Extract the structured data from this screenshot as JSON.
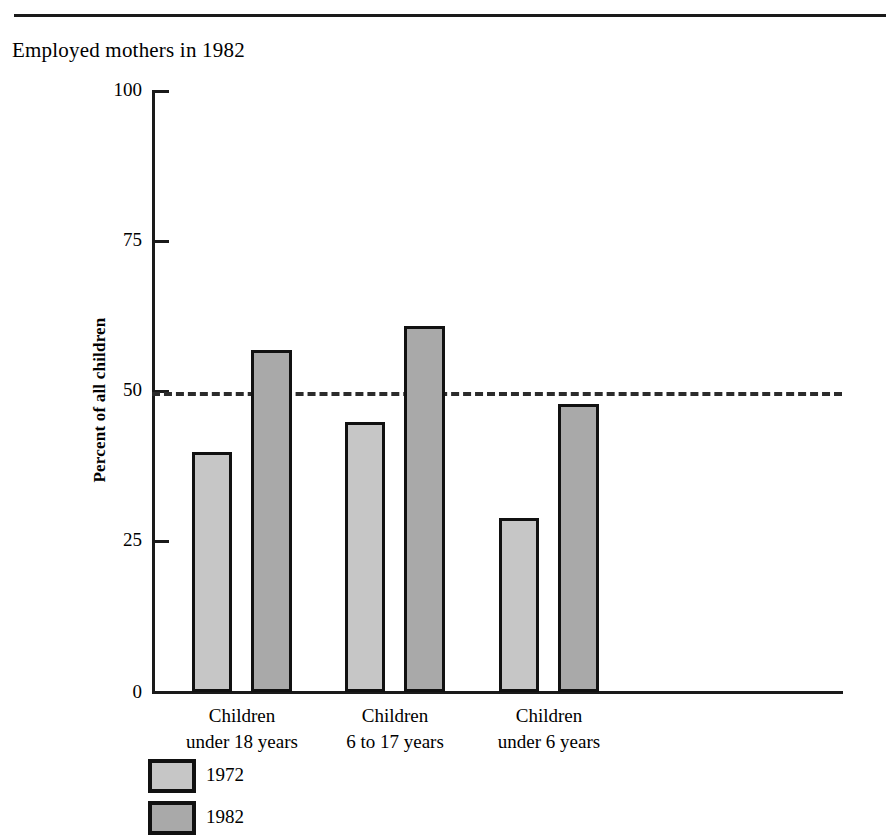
{
  "title": "Employed mothers in 1982",
  "chart_data": {
    "type": "bar",
    "title": "Employed mothers in 1982",
    "xlabel": "",
    "ylabel": "Percent of all children",
    "ylim": [
      0,
      100
    ],
    "yticks": [
      "0",
      "25",
      "50",
      "75",
      "100"
    ],
    "grid": false,
    "legend_position": "bottom-left",
    "reference_line": 50,
    "categories": [
      {
        "line1": "Children",
        "line2": "under 18 years"
      },
      {
        "line1": "Children",
        "line2": "6 to 17 years"
      },
      {
        "line1": "Children",
        "line2": "under 6 years"
      }
    ],
    "category_labels": [
      "Children under 18 years",
      "Children 6 to 17 years",
      "Children under 6 years"
    ],
    "series": [
      {
        "name": "1972",
        "color": "#c6c6c6",
        "values": [
          40,
          45,
          29
        ]
      },
      {
        "name": "1982",
        "color": "#a9a9a9",
        "values": [
          57,
          61,
          48
        ]
      }
    ]
  },
  "axis": {
    "tick_100": "100",
    "tick_75": "75",
    "tick_50": "50",
    "tick_25": "25",
    "tick_0": "0",
    "y_title": "Percent of all children"
  },
  "categories": {
    "c0_l1": "Children",
    "c0_l2": "under 18 years",
    "c1_l1": "Children",
    "c1_l2": "6 to 17 years",
    "c2_l1": "Children",
    "c2_l2": "under 6 years"
  },
  "legend": {
    "item0": "1972",
    "item1": "1982"
  }
}
